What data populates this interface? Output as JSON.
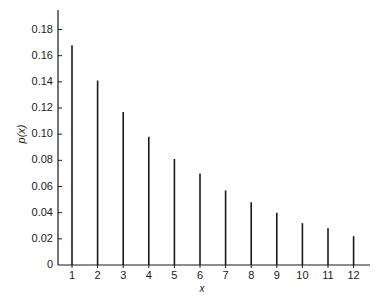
{
  "chart_data": {
    "type": "bar",
    "style": "vertical line (stem) plot",
    "title": "",
    "xlabel": "x",
    "ylabel": "p(x)",
    "categories": [
      "1",
      "2",
      "3",
      "4",
      "5",
      "6",
      "7",
      "8",
      "9",
      "10",
      "11",
      "12"
    ],
    "x": [
      1,
      2,
      3,
      4,
      5,
      6,
      7,
      8,
      9,
      10,
      11,
      12
    ],
    "values": [
      0.168,
      0.141,
      0.117,
      0.098,
      0.081,
      0.07,
      0.057,
      0.048,
      0.04,
      0.032,
      0.028,
      0.022
    ],
    "ylim": [
      0,
      0.19
    ],
    "yticks": [
      0,
      0.02,
      0.04,
      0.06,
      0.08,
      0.1,
      0.12,
      0.14,
      0.16,
      0.18
    ],
    "ytick_labels": [
      "0",
      "0.02",
      "0.04",
      "0.06",
      "0.08",
      "0.10",
      "0.12",
      "0.14",
      "0.16",
      "0.18"
    ],
    "xtick_labels": [
      "1",
      "2",
      "3",
      "4",
      "5",
      "6",
      "7",
      "8",
      "9",
      "10",
      "11",
      "12"
    ],
    "grid": false,
    "legend": null,
    "colors": {
      "line": "#1a1a1a",
      "background": "#ffffff"
    }
  }
}
